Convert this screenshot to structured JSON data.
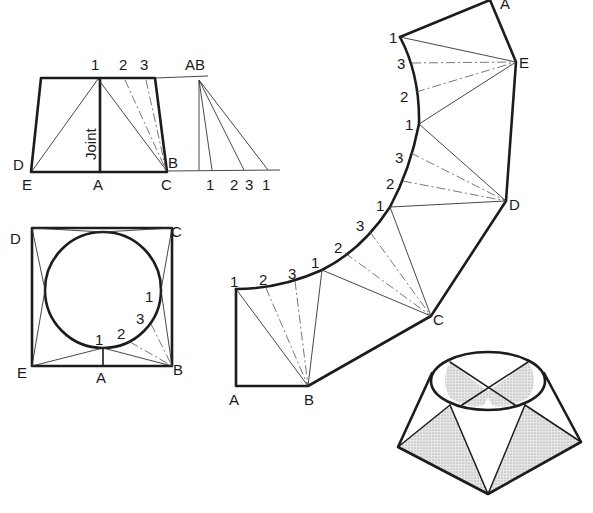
{
  "figure": {
    "type": "sheet-metal development drawing"
  },
  "elevation": {
    "label_joint": "Joint",
    "top_labels": [
      "1",
      "2",
      "3"
    ],
    "corner_labels": {
      "d": "D",
      "e": "E",
      "a": "A",
      "b": "B",
      "c": "C"
    },
    "true_length": {
      "apex_label": "AB",
      "base_labels": [
        "1",
        "2",
        "3",
        "1"
      ]
    }
  },
  "plan": {
    "corner_labels": {
      "d": "D",
      "c": "C",
      "e": "E",
      "b": "B",
      "a": "A"
    },
    "circle_labels": [
      "1",
      "2",
      "3",
      "1"
    ]
  },
  "development": {
    "corner_labels": [
      "A",
      "B",
      "C",
      "D",
      "E",
      "A"
    ],
    "arc_labels_lower": [
      "1",
      "2",
      "3",
      "1"
    ],
    "arc_labels_mid": [
      "2",
      "3",
      "1"
    ],
    "arc_labels_upper": [
      "3",
      "2",
      "1",
      "3",
      "1"
    ]
  },
  "pictorial": {
    "description": "isometric view of square-to-round transition with shaded triangular faces"
  }
}
